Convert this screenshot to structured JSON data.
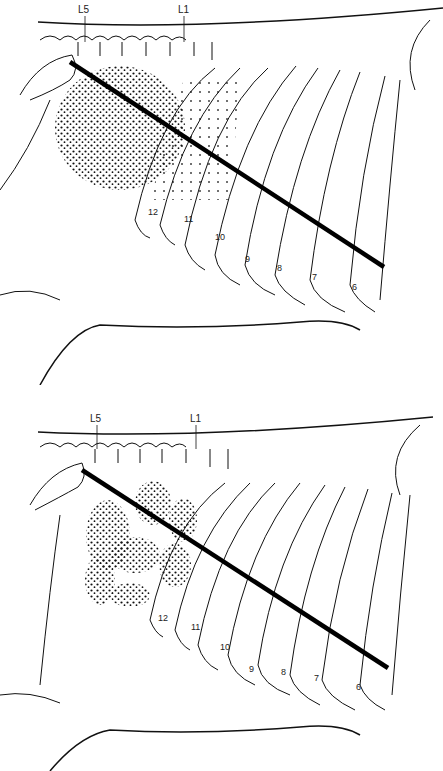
{
  "figure": {
    "colors": {
      "ink": "#111111",
      "background": "#ffffff",
      "stipple": "#111111"
    },
    "panels": [
      {
        "id": "top",
        "vertebra_labels": [
          "L5",
          "L1"
        ],
        "rib_labels": [
          "12",
          "11",
          "10",
          "9",
          "8",
          "7",
          "6"
        ],
        "stipple_pattern": "single large oval region",
        "line": "thick diagonal line from L5 region to rib 6"
      },
      {
        "id": "bottom",
        "vertebra_labels": [
          "L5",
          "L1"
        ],
        "rib_labels": [
          "12",
          "11",
          "10",
          "9",
          "8",
          "7",
          "6"
        ],
        "stipple_pattern": "multiple lobulated regions",
        "line": "thick diagonal line from L5 region to rib 6"
      }
    ]
  }
}
